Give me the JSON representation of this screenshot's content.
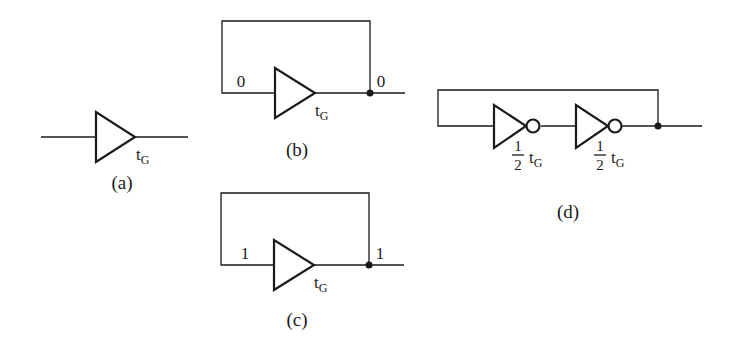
{
  "figure": {
    "subfigures": [
      {
        "id": "a",
        "caption": "(a)",
        "gate": {
          "type": "buffer",
          "delay_label": "t",
          "delay_subscript": "G"
        }
      },
      {
        "id": "b",
        "caption": "(b)",
        "gate": {
          "type": "buffer",
          "delay_label": "t",
          "delay_subscript": "G"
        },
        "feedback_loop": true,
        "input_value": "0",
        "output_value": "0"
      },
      {
        "id": "c",
        "caption": "(c)",
        "gate": {
          "type": "buffer",
          "delay_label": "t",
          "delay_subscript": "G"
        },
        "feedback_loop": true,
        "input_value": "1",
        "output_value": "1"
      },
      {
        "id": "d",
        "caption": "(d)",
        "feedback_loop": true,
        "gates": [
          {
            "type": "inverter",
            "frac_num": "1",
            "frac_den": "2",
            "delay_label": "t",
            "delay_subscript": "G"
          },
          {
            "type": "inverter",
            "frac_num": "1",
            "frac_den": "2",
            "delay_label": "t",
            "delay_subscript": "G"
          }
        ]
      }
    ]
  },
  "colors": {
    "ink": "#1a1a1a",
    "background": "#ffffff"
  }
}
